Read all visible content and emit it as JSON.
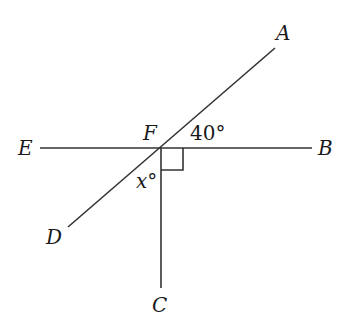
{
  "diagram": {
    "points": {
      "A": {
        "label": "A",
        "x": 275,
        "y": 48
      },
      "B": {
        "label": "B",
        "x": 312,
        "y": 148
      },
      "C": {
        "label": "C",
        "x": 161,
        "y": 288
      },
      "D": {
        "label": "D",
        "x": 68,
        "y": 227
      },
      "E": {
        "label": "E",
        "x": 40,
        "y": 148
      },
      "F": {
        "label": "F",
        "x": 161,
        "y": 148
      }
    },
    "angles": {
      "angle_AFB": "40°",
      "angle_DFC": "x°",
      "right_angle": "BFC"
    },
    "colors": {
      "stroke": "#333333",
      "text": "#1a1a1a",
      "background": "#ffffff"
    }
  }
}
